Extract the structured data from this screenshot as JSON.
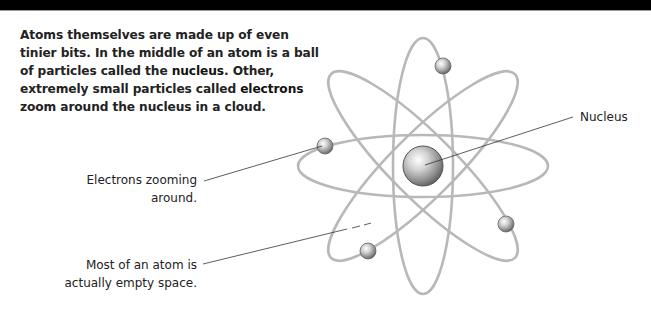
{
  "header": {
    "bar_color": "#000000"
  },
  "intro": {
    "parts": [
      "Atoms themselves are made up of even tinier bits. In the middle of an atom is a ball of particles called the ",
      "nucleus",
      ". Other, extremely small particles called ",
      "electrons",
      " zoom around the nucleus in a cloud."
    ]
  },
  "labels": {
    "nucleus": "Nucleus",
    "electrons_line1": "Electrons zooming",
    "electrons_line2": "around.",
    "space_line1": "Most of an atom is",
    "space_line2": "actually empty space."
  },
  "diagram": {
    "center": [
      423,
      166
    ],
    "orbit_color": "#b8b8b8",
    "orbits": [
      {
        "name": "horizontal",
        "rx": 125,
        "ry": 31,
        "rotate": 0
      },
      {
        "name": "vertical",
        "rx": 30,
        "ry": 128,
        "rotate": 0
      },
      {
        "name": "diagonal-left",
        "rx": 130,
        "ry": 32,
        "rotate": 45
      },
      {
        "name": "diagonal-right",
        "rx": 130,
        "ry": 32,
        "rotate": -45
      }
    ],
    "nucleus": {
      "cx": 423,
      "cy": 166,
      "r": 20
    },
    "electrons": [
      {
        "cx": 443,
        "cy": 66
      },
      {
        "cx": 325,
        "cy": 146
      },
      {
        "cx": 506,
        "cy": 224
      },
      {
        "cx": 368,
        "cy": 251
      }
    ]
  }
}
